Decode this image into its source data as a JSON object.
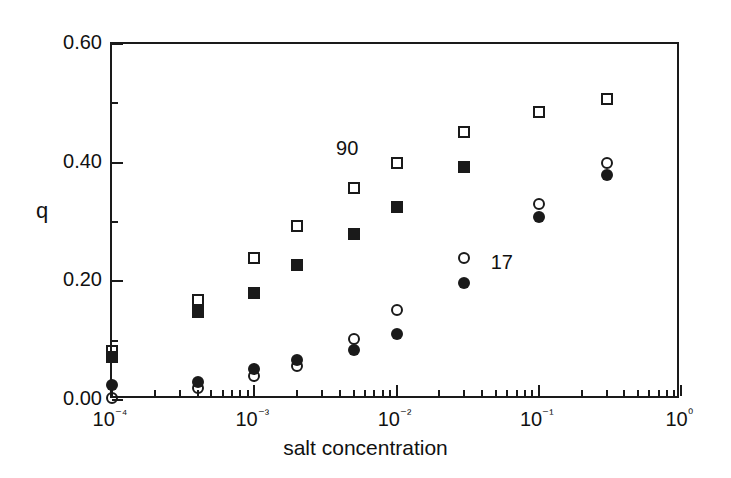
{
  "chart_data": {
    "type": "scatter",
    "title": "",
    "xlabel": "salt concentration",
    "ylabel": "q",
    "xscale": "log",
    "yscale": "linear",
    "xlim": [
      0.0001,
      1
    ],
    "ylim": [
      0.0,
      0.6
    ],
    "grid": false,
    "legend": "inline-annotations",
    "x_tick_labels": [
      "10⁻⁴",
      "10⁻³",
      "10⁻²",
      "10⁻¹",
      "10⁰"
    ],
    "x_tick_values": [
      0.0001,
      0.001,
      0.01,
      0.1,
      1
    ],
    "y_tick_labels": [
      "0.00",
      "0.20",
      "0.40",
      "0.60"
    ],
    "y_tick_values": [
      0.0,
      0.2,
      0.4,
      0.6
    ],
    "y_minor_tick_values": [
      0.1,
      0.3,
      0.5
    ],
    "annotations": [
      {
        "text": "90",
        "x": 0.0045,
        "y": 0.425
      },
      {
        "text": "17",
        "x": 0.055,
        "y": 0.232
      }
    ],
    "series": [
      {
        "name": "90 open squares",
        "marker": "open-square",
        "color": "#1a1a1a",
        "x": [
          0.0001,
          0.0004,
          0.001,
          0.002,
          0.005,
          0.01,
          0.03,
          0.1,
          0.3
        ],
        "values": [
          0.082,
          0.168,
          0.24,
          0.293,
          0.358,
          0.4,
          0.452,
          0.485,
          0.507
        ]
      },
      {
        "name": "90 filled squares",
        "marker": "filled-square",
        "color": "#1a1a1a",
        "x": [
          0.0001,
          0.0004,
          0.001,
          0.002,
          0.005,
          0.01,
          0.03
        ],
        "values": [
          0.072,
          0.148,
          0.18,
          0.228,
          0.28,
          0.325,
          0.392
        ]
      },
      {
        "name": "17 open circles",
        "marker": "open-circle",
        "color": "#1a1a1a",
        "x": [
          0.0001,
          0.0004,
          0.001,
          0.002,
          0.005,
          0.01,
          0.03,
          0.1,
          0.3
        ],
        "values": [
          0.003,
          0.02,
          0.04,
          0.058,
          0.103,
          0.152,
          0.24,
          0.33,
          0.4
        ]
      },
      {
        "name": "17 filled circles",
        "marker": "filled-circle",
        "color": "#1a1a1a",
        "x": [
          0.0001,
          0.0004,
          0.001,
          0.002,
          0.005,
          0.01,
          0.03,
          0.1,
          0.3
        ],
        "values": [
          0.025,
          0.03,
          0.052,
          0.068,
          0.085,
          0.112,
          0.197,
          0.308,
          0.38
        ]
      }
    ]
  }
}
